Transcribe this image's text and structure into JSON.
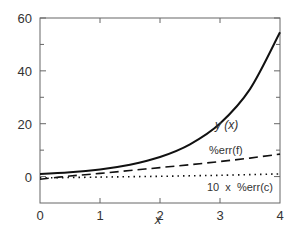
{
  "chart_data": {
    "type": "line",
    "title": "",
    "xlabel": "x",
    "ylabel": "",
    "xlim": [
      0,
      4
    ],
    "ylim": [
      -10,
      60
    ],
    "x_ticks": [
      0,
      1,
      2,
      3,
      4
    ],
    "x_tick_labels": [
      "0",
      "1",
      "2",
      "3",
      "4"
    ],
    "y_ticks": [
      0,
      20,
      40,
      60
    ],
    "y_tick_labels": [
      "0",
      "20",
      "40",
      "60"
    ],
    "y_minor_ticks": [
      -10,
      10,
      30,
      50
    ],
    "grid": false,
    "legend": "inline annotations",
    "series": [
      {
        "name": "y (x)",
        "style": "solid",
        "x": [
          0,
          0.5,
          1,
          1.5,
          2,
          2.5,
          3,
          3.5,
          4
        ],
        "values": [
          1,
          1.6,
          2.7,
          4.5,
          7.4,
          12.2,
          20.1,
          33.1,
          54.6
        ]
      },
      {
        "name": "%err(f)",
        "style": "dashed",
        "x": [
          0,
          0.5,
          1,
          1.5,
          2,
          2.5,
          3,
          3.5,
          4
        ],
        "values": [
          -1,
          0.2,
          1.2,
          2.3,
          3.4,
          4.5,
          5.7,
          7.0,
          8.5
        ]
      },
      {
        "name": "10 x %err(c)",
        "style": "dotted",
        "x": [
          0,
          1,
          2,
          3,
          4
        ],
        "values": [
          -0.5,
          -0.2,
          0.1,
          0.5,
          1.0
        ]
      }
    ],
    "annotations": [
      {
        "text": "y (x)",
        "x": 2.9,
        "y": 27
      },
      {
        "text": "%err(f)",
        "x": 3.0,
        "y": 9.5
      },
      {
        "text": "10  x  %err(c)",
        "x": 2.85,
        "y": -5
      }
    ]
  }
}
